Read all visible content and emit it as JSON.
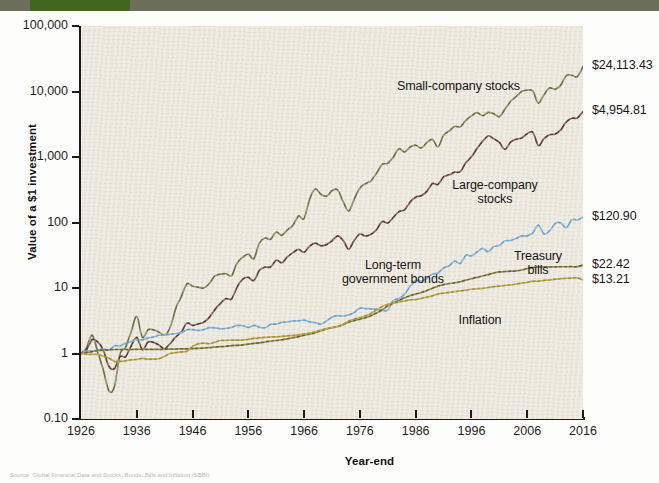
{
  "figure": {
    "background_color": "#fdfdfb",
    "plot_background_color": "#ece8dd",
    "header_band_color": "#6d6f5c",
    "header_tab_color": "#41661e",
    "source_note": "Source: Global Financial Data and Stocks, Bonds, Bills and Inflation (SBBI)"
  },
  "chart_data": {
    "type": "line",
    "title": "",
    "subtitle": "",
    "xlabel": "Year-end",
    "ylabel": "Value of a $1 investment",
    "yscale": "log",
    "ylim": [
      0.1,
      100000
    ],
    "xlim": [
      1926,
      2016
    ],
    "grid": false,
    "legend_position": "inline-annotations",
    "ytick_labels": [
      "100,000",
      "10,000",
      "1,000",
      "100",
      "10",
      "1",
      "0.10"
    ],
    "ytick_values": [
      100000,
      10000,
      1000,
      100,
      10,
      1,
      0.1
    ],
    "xtick_labels": [
      "1926",
      "1936",
      "1946",
      "1956",
      "1966",
      "1976",
      "1986",
      "1996",
      "2006",
      "2016"
    ],
    "xtick_values": [
      1926,
      1936,
      1946,
      1956,
      1966,
      1976,
      1986,
      1996,
      2006,
      2016
    ],
    "series": [
      {
        "name": "Small-company stocks",
        "color": "#6b7044",
        "final_value": 24113.43,
        "final_label": "$24,113.43",
        "annotation": "Small-company stocks",
        "x": [
          1926,
          1927,
          1928,
          1929,
          1930,
          1931,
          1932,
          1933,
          1934,
          1935,
          1936,
          1937,
          1938,
          1939,
          1940,
          1941,
          1942,
          1943,
          1944,
          1945,
          1946,
          1947,
          1948,
          1949,
          1950,
          1951,
          1952,
          1953,
          1954,
          1955,
          1956,
          1957,
          1958,
          1959,
          1960,
          1961,
          1962,
          1963,
          1964,
          1965,
          1966,
          1967,
          1968,
          1969,
          1970,
          1971,
          1972,
          1973,
          1974,
          1975,
          1976,
          1977,
          1978,
          1979,
          1980,
          1981,
          1982,
          1983,
          1984,
          1985,
          1986,
          1987,
          1988,
          1989,
          1990,
          1991,
          1992,
          1993,
          1994,
          1995,
          1996,
          1997,
          1998,
          1999,
          2000,
          2001,
          2002,
          2003,
          2004,
          2005,
          2006,
          2007,
          2008,
          2009,
          2010,
          2011,
          2012,
          2013,
          2014,
          2015,
          2016
        ],
        "values": [
          1.0,
          1.22,
          1.91,
          1.05,
          0.56,
          0.27,
          0.31,
          0.99,
          1.25,
          2.17,
          3.68,
          1.77,
          2.31,
          2.29,
          2.11,
          1.92,
          2.52,
          4.92,
          7.45,
          11.61,
          10.63,
          10.33,
          10.0,
          11.7,
          15.27,
          16.3,
          16.54,
          15.48,
          24.08,
          29.46,
          33.0,
          28.15,
          48.91,
          58.02,
          55.59,
          71.53,
          63.73,
          77.16,
          90.98,
          125.33,
          115.57,
          229.61,
          325.39,
          270.68,
          250.94,
          304.89,
          316.26,
          208.55,
          149.56,
          229.02,
          337.7,
          390.26,
          433.84,
          567.78,
          770.54,
          800.95,
          1000.22,
          1335.92,
          1193.06,
          1419.81,
          1522.5,
          1371.87,
          1654.63,
          1855.24,
          1429.43,
          2143.97,
          2490.48,
          2922.57,
          2889.6,
          3618.92,
          4241.25,
          4767.46,
          4264.88,
          4798.27,
          4569.69,
          4121.48,
          5339.37,
          7050.2,
          8336.74,
          10021.09,
          10461.43,
          10177.79,
          6636.51,
          8930.67,
          11266.37,
          10843.58,
          12503.67,
          17505.14,
          17680.19,
          16885.42,
          24113.43
        ]
      },
      {
        "name": "Large-company stocks",
        "color": "#5a3a32",
        "final_value": 4954.81,
        "final_label": "$4,954.81",
        "annotation": "Large-company\nstocks",
        "x": [
          1926,
          1927,
          1928,
          1929,
          1930,
          1931,
          1932,
          1933,
          1934,
          1935,
          1936,
          1937,
          1938,
          1939,
          1940,
          1941,
          1942,
          1943,
          1944,
          1945,
          1946,
          1947,
          1948,
          1949,
          1950,
          1951,
          1952,
          1953,
          1954,
          1955,
          1956,
          1957,
          1958,
          1959,
          1960,
          1961,
          1962,
          1963,
          1964,
          1965,
          1966,
          1967,
          1968,
          1969,
          1970,
          1971,
          1972,
          1973,
          1974,
          1975,
          1976,
          1977,
          1978,
          1979,
          1980,
          1981,
          1982,
          1983,
          1984,
          1985,
          1986,
          1987,
          1988,
          1989,
          1990,
          1991,
          1992,
          1993,
          1994,
          1995,
          1996,
          1997,
          1998,
          1999,
          2000,
          2001,
          2002,
          2003,
          2004,
          2005,
          2006,
          2007,
          2008,
          2009,
          2010,
          2011,
          2012,
          2013,
          2014,
          2015,
          2016
        ],
        "values": [
          1.0,
          1.14,
          1.64,
          1.5,
          1.13,
          0.64,
          0.59,
          0.9,
          0.89,
          1.31,
          1.76,
          1.14,
          1.49,
          1.48,
          1.34,
          1.18,
          1.42,
          1.79,
          2.14,
          2.92,
          2.68,
          2.83,
          2.99,
          3.56,
          4.68,
          5.81,
          6.88,
          6.81,
          10.39,
          13.66,
          14.55,
          12.98,
          18.62,
          20.85,
          20.96,
          26.59,
          24.26,
          29.8,
          34.69,
          39.01,
          35.08,
          43.47,
          48.28,
          44.18,
          45.96,
          52.53,
          62.48,
          53.32,
          39.18,
          53.78,
          66.62,
          61.86,
          65.92,
          78.07,
          103.39,
          98.27,
          119.41,
          146.37,
          155.57,
          204.93,
          243.11,
          255.86,
          298.53,
          392.93,
          380.71,
          496.68,
          534.47,
          588.23,
          595.96,
          819.84,
          1008.09,
          1344.45,
          1728.71,
          2092.38,
          1901.95,
          1675.94,
          1305.62,
          1680.24,
          1863.66,
          1954.79,
          2263.59,
          2387.13,
          1504.1,
          1902.04,
          2188.88,
          2235.72,
          2593.54,
          3433.79,
          3903.3,
          3957.58,
          4954.81
        ]
      },
      {
        "name": "Long-term government bonds",
        "color": "#6aa5d0",
        "final_value": 120.9,
        "final_label": "$120.90",
        "annotation": "Long-term\ngovernment bonds",
        "x": [
          1926,
          1927,
          1928,
          1929,
          1930,
          1931,
          1932,
          1933,
          1934,
          1935,
          1936,
          1937,
          1938,
          1939,
          1940,
          1941,
          1942,
          1943,
          1944,
          1945,
          1946,
          1947,
          1948,
          1949,
          1950,
          1951,
          1952,
          1953,
          1954,
          1955,
          1956,
          1957,
          1958,
          1959,
          1960,
          1961,
          1962,
          1963,
          1964,
          1965,
          1966,
          1967,
          1968,
          1969,
          1970,
          1971,
          1972,
          1973,
          1974,
          1975,
          1976,
          1977,
          1978,
          1979,
          1980,
          1981,
          1982,
          1983,
          1984,
          1985,
          1986,
          1987,
          1988,
          1989,
          1990,
          1991,
          1992,
          1993,
          1994,
          1995,
          1996,
          1997,
          1998,
          1999,
          2000,
          2001,
          2002,
          2003,
          2004,
          2005,
          2006,
          2007,
          2008,
          2009,
          2010,
          2011,
          2012,
          2013,
          2014,
          2015,
          2016
        ],
        "values": [
          1.0,
          1.09,
          1.09,
          1.13,
          1.18,
          1.12,
          1.31,
          1.31,
          1.44,
          1.51,
          1.62,
          1.62,
          1.72,
          1.79,
          1.9,
          1.91,
          1.97,
          2.02,
          2.08,
          2.31,
          2.31,
          2.25,
          2.32,
          2.47,
          2.47,
          2.38,
          2.41,
          2.5,
          2.68,
          2.65,
          2.5,
          2.68,
          2.52,
          2.46,
          2.79,
          2.81,
          2.99,
          3.03,
          3.14,
          3.15,
          3.24,
          3.04,
          2.96,
          2.8,
          3.14,
          3.58,
          3.78,
          3.74,
          3.88,
          4.23,
          4.93,
          4.86,
          4.79,
          4.73,
          4.53,
          4.61,
          6.43,
          6.92,
          7.97,
          10.56,
          13.01,
          12.68,
          14.01,
          16.32,
          16.97,
          20.22,
          21.85,
          25.82,
          23.71,
          31.67,
          30.88,
          35.39,
          40.36,
          35.83,
          43.0,
          44.52,
          52.59,
          52.95,
          57.11,
          62.37,
          62.36,
          69.18,
          91.25,
          66.65,
          74.54,
          96.19,
          99.16,
          83.45,
          110.27,
          109.47,
          120.9
        ]
      },
      {
        "name": "Treasury bills",
        "color": "#6b6426",
        "final_value": 22.42,
        "final_label": "$22.42",
        "annotation": "Treasury\nbills",
        "x": [
          1926,
          1927,
          1928,
          1929,
          1930,
          1931,
          1932,
          1933,
          1934,
          1935,
          1936,
          1937,
          1938,
          1939,
          1940,
          1941,
          1942,
          1943,
          1944,
          1945,
          1946,
          1947,
          1948,
          1949,
          1950,
          1951,
          1952,
          1953,
          1954,
          1955,
          1956,
          1957,
          1958,
          1959,
          1960,
          1961,
          1962,
          1963,
          1964,
          1965,
          1966,
          1967,
          1968,
          1969,
          1970,
          1971,
          1972,
          1973,
          1974,
          1975,
          1976,
          1977,
          1978,
          1979,
          1980,
          1981,
          1982,
          1983,
          1984,
          1985,
          1986,
          1987,
          1988,
          1989,
          1990,
          1991,
          1992,
          1993,
          1994,
          1995,
          1996,
          1997,
          1998,
          1999,
          2000,
          2001,
          2002,
          2003,
          2004,
          2005,
          2006,
          2007,
          2008,
          2009,
          2010,
          2011,
          2012,
          2013,
          2014,
          2015,
          2016
        ],
        "values": [
          1.0,
          1.03,
          1.07,
          1.11,
          1.13,
          1.14,
          1.15,
          1.15,
          1.15,
          1.15,
          1.16,
          1.16,
          1.16,
          1.16,
          1.16,
          1.16,
          1.17,
          1.17,
          1.18,
          1.18,
          1.19,
          1.2,
          1.21,
          1.23,
          1.25,
          1.27,
          1.29,
          1.32,
          1.33,
          1.35,
          1.39,
          1.43,
          1.45,
          1.5,
          1.54,
          1.58,
          1.62,
          1.68,
          1.74,
          1.81,
          1.9,
          1.98,
          2.08,
          2.22,
          2.37,
          2.48,
          2.58,
          2.76,
          3.0,
          3.18,
          3.34,
          3.51,
          3.77,
          4.17,
          4.64,
          5.34,
          5.91,
          6.43,
          7.07,
          7.62,
          8.08,
          8.53,
          9.13,
          9.89,
          10.66,
          11.26,
          11.66,
          11.99,
          12.47,
          13.16,
          13.83,
          14.55,
          15.26,
          15.97,
          16.92,
          17.58,
          17.87,
          18.06,
          18.28,
          18.82,
          19.74,
          20.65,
          21.01,
          21.03,
          21.06,
          21.07,
          21.09,
          21.11,
          21.13,
          21.14,
          22.42
        ]
      },
      {
        "name": "Inflation",
        "color": "#a8922e",
        "final_value": 13.21,
        "final_label": "$13.21",
        "annotation": "Inflation",
        "x": [
          1926,
          1927,
          1928,
          1929,
          1930,
          1931,
          1932,
          1933,
          1934,
          1935,
          1936,
          1937,
          1938,
          1939,
          1940,
          1941,
          1942,
          1943,
          1944,
          1945,
          1946,
          1947,
          1948,
          1949,
          1950,
          1951,
          1952,
          1953,
          1954,
          1955,
          1956,
          1957,
          1958,
          1959,
          1960,
          1961,
          1962,
          1963,
          1964,
          1965,
          1966,
          1967,
          1968,
          1969,
          1970,
          1971,
          1972,
          1973,
          1974,
          1975,
          1976,
          1977,
          1978,
          1979,
          1980,
          1981,
          1982,
          1983,
          1984,
          1985,
          1986,
          1987,
          1988,
          1989,
          1990,
          1991,
          1992,
          1993,
          1994,
          1995,
          1996,
          1997,
          1998,
          1999,
          2000,
          2001,
          2002,
          2003,
          2004,
          2005,
          2006,
          2007,
          2008,
          2009,
          2010,
          2011,
          2012,
          2013,
          2014,
          2015,
          2016
        ],
        "values": [
          1.0,
          0.98,
          0.97,
          0.97,
          0.91,
          0.85,
          0.76,
          0.76,
          0.77,
          0.8,
          0.81,
          0.84,
          0.82,
          0.82,
          0.83,
          0.91,
          1.0,
          1.03,
          1.06,
          1.08,
          1.28,
          1.4,
          1.44,
          1.41,
          1.49,
          1.58,
          1.59,
          1.6,
          1.6,
          1.6,
          1.65,
          1.7,
          1.73,
          1.76,
          1.79,
          1.8,
          1.83,
          1.86,
          1.88,
          1.92,
          1.99,
          2.05,
          2.15,
          2.28,
          2.4,
          2.48,
          2.57,
          2.79,
          3.13,
          3.35,
          3.51,
          3.75,
          4.09,
          4.63,
          5.2,
          5.66,
          5.88,
          6.1,
          6.34,
          6.58,
          6.65,
          6.95,
          7.26,
          7.6,
          8.07,
          8.32,
          8.56,
          8.8,
          9.03,
          9.26,
          9.57,
          9.74,
          9.9,
          10.17,
          10.52,
          10.68,
          10.94,
          11.15,
          11.51,
          11.9,
          12.2,
          12.71,
          12.7,
          13.05,
          13.25,
          13.64,
          13.87,
          14.08,
          14.19,
          14.29,
          13.21
        ]
      }
    ]
  },
  "annotations": {
    "small_company": "Small-company stocks",
    "large_company": "Large-company\nstocks",
    "lt_gov_bonds": "Long-term\ngovernment bonds",
    "treasury_bills": "Treasury\nbills",
    "inflation": "Inflation"
  },
  "end_labels": {
    "small_company": "$24,113.43",
    "large_company": "$4,954.81",
    "lt_gov_bonds": "$120.90",
    "treasury_bills": "$22.42",
    "inflation": "$13.21"
  }
}
